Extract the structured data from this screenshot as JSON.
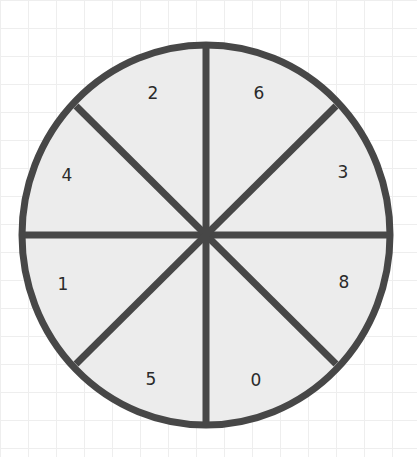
{
  "wheel": {
    "center": [
      206,
      235
    ],
    "rx": 184,
    "ry": 190,
    "fill": "#ececec",
    "stroke": "#474747",
    "stroke_width": 7,
    "segments": [
      {
        "label": "6",
        "position": [
          259,
          93
        ]
      },
      {
        "label": "3",
        "position": [
          343,
          172
        ]
      },
      {
        "label": "8",
        "position": [
          344,
          282
        ]
      },
      {
        "label": "0",
        "position": [
          256,
          380
        ]
      },
      {
        "label": "5",
        "position": [
          151,
          379
        ]
      },
      {
        "label": "1",
        "position": [
          63,
          284
        ]
      },
      {
        "label": "4",
        "position": [
          67,
          175
        ]
      },
      {
        "label": "2",
        "position": [
          153,
          93
        ]
      }
    ]
  }
}
